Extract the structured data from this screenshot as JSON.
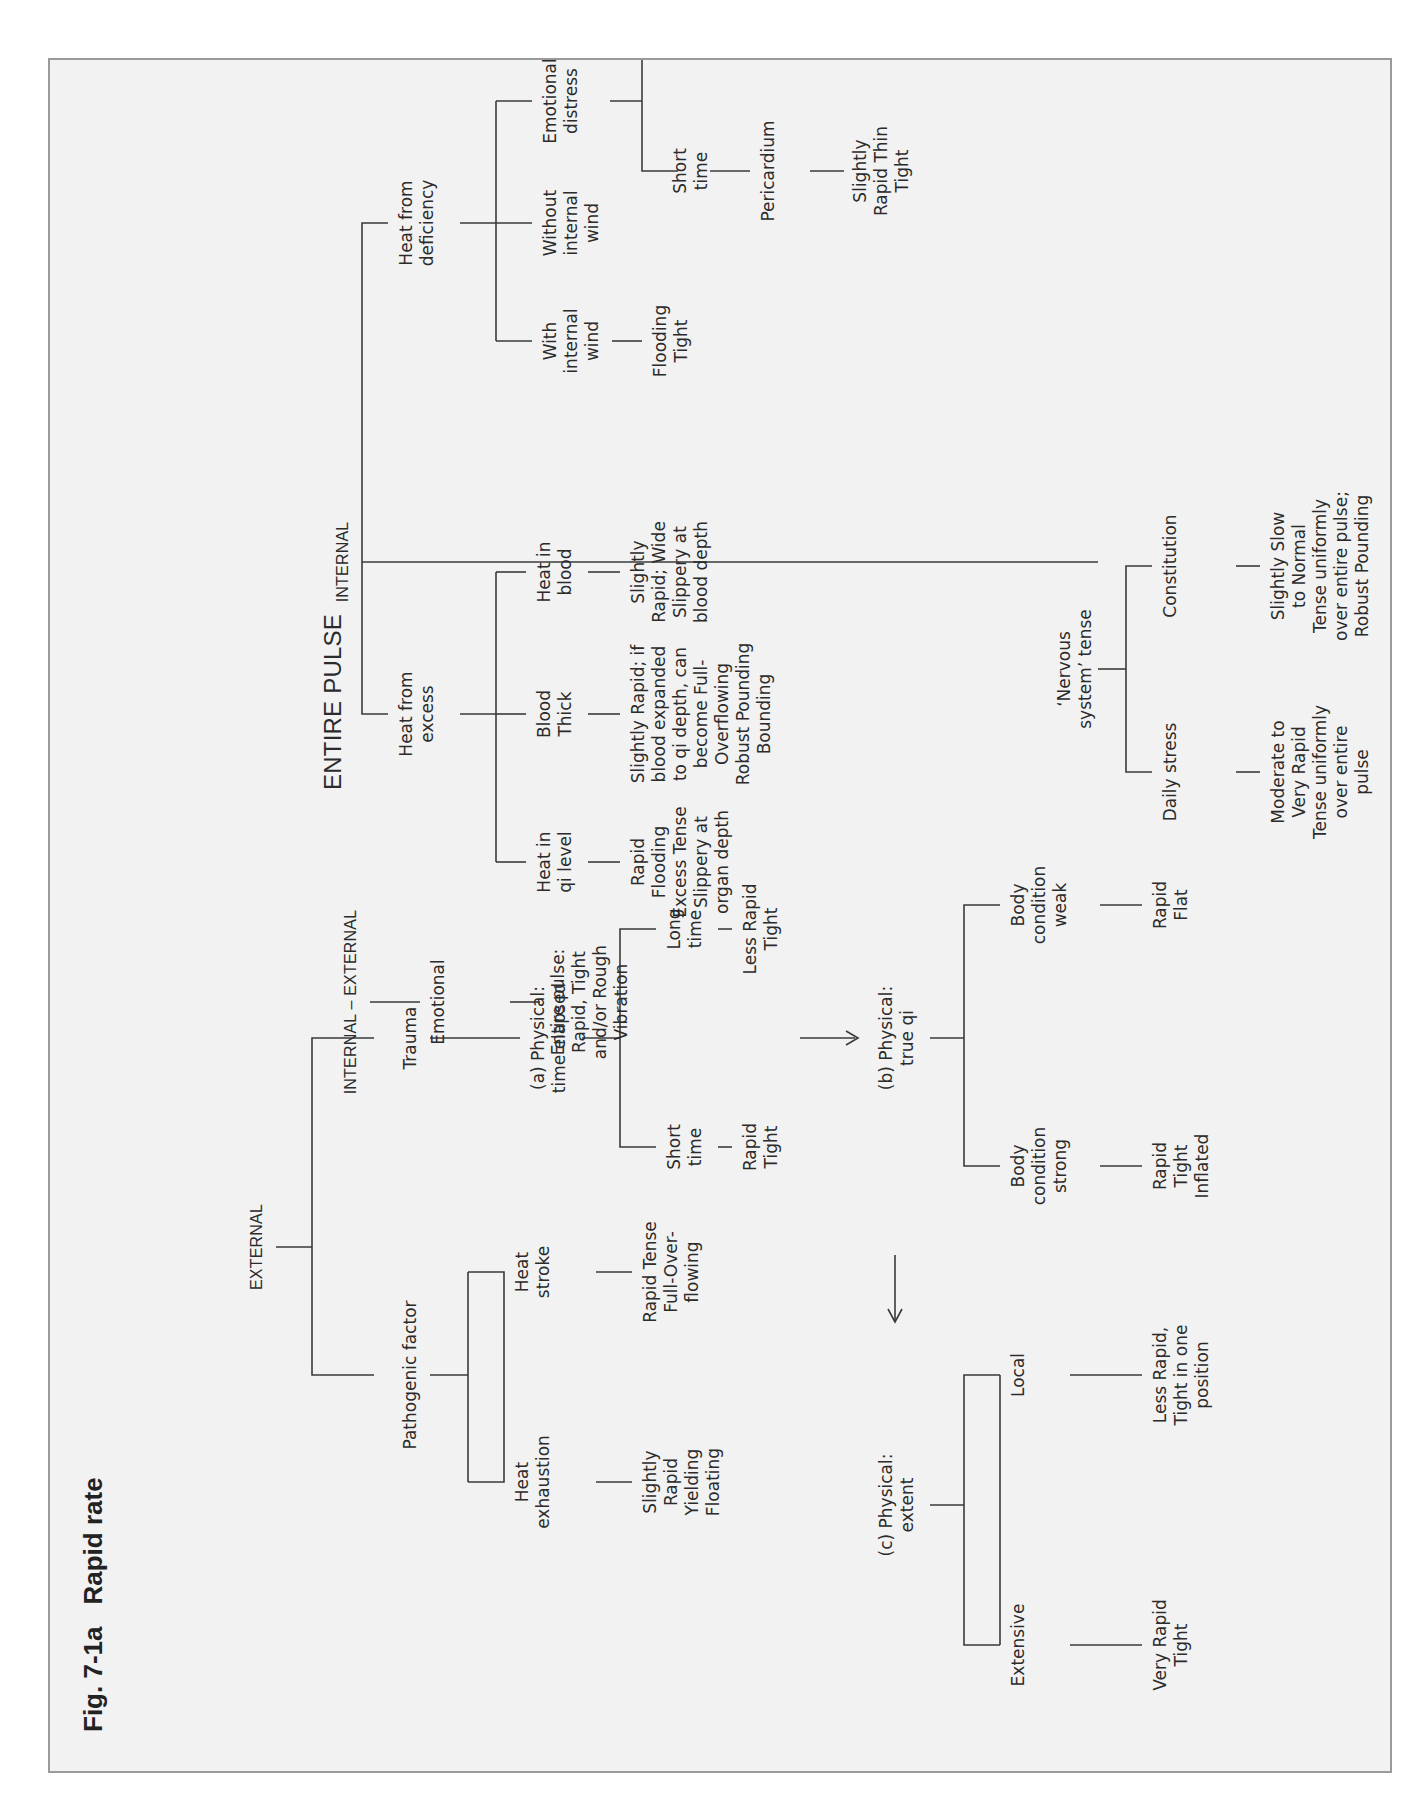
{
  "figure": {
    "number": "Fig. 7-1a",
    "title": "Rapid rate"
  },
  "headers": {
    "external": "EXTERNAL",
    "internal_external": "INTERNAL – EXTERNAL",
    "entire_pulse": "ENTIRE PULSE",
    "internal": "INTERNAL"
  },
  "external": {
    "pathogenic_factor": {
      "label": "Pathogenic factor",
      "heat_exhaustion": {
        "label": "Heat\nexhaustion",
        "result": "Slightly\nRapid\nYielding\nFloating"
      },
      "heat_stroke": {
        "label": "Heat\nstroke",
        "result": "Rapid Tense\nFull-Over-\nflowing"
      }
    },
    "trauma": {
      "label": "Trauma",
      "a": {
        "label": "(a) Physical:\ntime elapsed",
        "short_time": {
          "label": "Short\ntime",
          "result": "Rapid\nTight"
        },
        "long_time": {
          "label": "Long\ntime",
          "result": "Less Rapid\nTight"
        }
      },
      "b": {
        "label": "(b) Physical:\ntrue qi",
        "strong": {
          "label": "Body\ncondition\nstrong",
          "result": "Rapid\nTight\nInflated"
        },
        "weak": {
          "label": "Body\ncondition\nweak",
          "result": "Rapid\nFlat"
        }
      },
      "c": {
        "label": "(c) Physical:\nextent",
        "extensive": {
          "label": "Extensive",
          "result": "Very Rapid\nTight"
        },
        "local": {
          "label": "Local",
          "result": "Less Rapid,\nTight in one\nposition"
        }
      }
    }
  },
  "internal_external": {
    "emotional": {
      "label": "Emotional",
      "result": "Entire pulse:\nRapid, Tight\nand/or Rough\nVibration"
    }
  },
  "internal": {
    "heat_from_excess": {
      "label": "Heat from\nexcess",
      "qi_level": {
        "label": "Heat in\nqi level",
        "result": "Rapid\nFlooding\nExcess Tense\nSlippery at\norgan depth"
      },
      "blood_thick": {
        "label": "Blood\nThick",
        "result": "Slightly Rapid; if\nblood expanded\nto qi depth, can\nbecome Full-\nOverflowing\nRobust Pounding\nBounding"
      },
      "heat_in_blood": {
        "label": "Heat in\nblood",
        "result": "Slightly\nRapid; Wide\nSlippery at\nblood depth"
      }
    },
    "nervous_system": {
      "label": "‘Nervous\nsystem’ tense",
      "daily_stress": {
        "label": "Daily stress",
        "result": "Moderate to\nVery Rapid\nTense uniformly\nover entire\npulse"
      },
      "constitution": {
        "label": "Constitution",
        "result": "Slightly Slow\nto Normal\nTense uniformly\nover entire pulse;\nRobust Pounding"
      }
    },
    "heat_from_deficiency": {
      "label": "Heat from\ndeficiency",
      "with_wind": {
        "label": "With\ninternal\nwind",
        "result": "Flooding\nTight"
      },
      "without_wind": {
        "label": "Without\ninternal\nwind"
      },
      "emotional_distress": {
        "label": "Emotional\ndistress",
        "short_time": {
          "label": "Short\ntime",
          "site": "Pericardium",
          "result": "Slightly\nRapid Thin\nTight"
        },
        "long_time": {
          "label": "Long\ntime",
          "site": "Left\ndistal\nposition",
          "result": "Slightly Rapid\nThinner, very\nTight-Wiry"
        }
      }
    }
  }
}
